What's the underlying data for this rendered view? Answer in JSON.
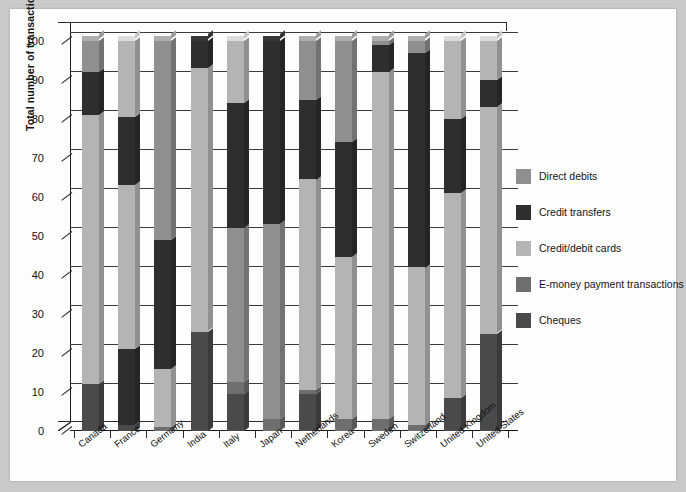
{
  "chart_data": {
    "type": "bar",
    "subtype": "stacked-percentage-3d",
    "title": "",
    "xlabel": "",
    "ylabel": "Total number of transactions (%)",
    "ylim": [
      0,
      100
    ],
    "yticks": [
      0,
      10,
      20,
      30,
      40,
      50,
      60,
      70,
      80,
      90,
      100
    ],
    "ytick_labels": [
      "0",
      "10",
      "20",
      "30",
      "40",
      "50",
      "60",
      "70",
      "80",
      "90",
      "100"
    ],
    "grid": true,
    "legend_position": "right",
    "categories": [
      "Canada",
      "France",
      "Germany",
      "India",
      "Italy",
      "Japan",
      "Netherlands",
      "Korea",
      "Sweden",
      "Switzerland",
      "United Kingdom",
      "United States"
    ],
    "series": [
      {
        "name": "Cheques",
        "color": "#4a4a4a",
        "values": [
          12.0,
          1.5,
          0.0,
          25.5,
          9.5,
          0.0,
          9.5,
          0.0,
          0.0,
          0.0,
          8.5,
          25.0
        ]
      },
      {
        "name": "E-money payment transactions",
        "color": "#6e6e6e",
        "values": [
          0.0,
          0.0,
          1.0,
          0.0,
          3.0,
          3.0,
          0.5,
          3.0,
          3.0,
          1.5,
          0.0,
          0.0
        ]
      },
      {
        "name": "Credit/debit cards",
        "color": "#b4b4b4",
        "values": [
          69.0,
          61.0,
          15.0,
          67.5,
          0.0,
          0.0,
          54.0,
          41.0,
          89.0,
          40.5,
          52.5,
          58.0
        ]
      },
      {
        "name": "Credit transfers",
        "color": "#2e2e2e",
        "values": [
          11.0,
          17.5,
          33.0,
          7.0,
          39.5,
          0.0,
          0.0,
          0.0,
          7.0,
          0.0,
          0.0,
          0.0
        ]
      },
      {
        "name": "Direct debits",
        "color": "#8f8f8f",
        "values": [
          8.0,
          20.0,
          51.0,
          0.0,
          0.0,
          50.0,
          0.0,
          0.0,
          1.0,
          1.0,
          0.0,
          0.0
        ]
      }
    ],
    "stacks": [
      {
        "category": "Canada",
        "segments": [
          {
            "series": "Cheques",
            "from": 0,
            "to": 12
          },
          {
            "series": "Credit/debit cards",
            "from": 12,
            "to": 81
          },
          {
            "series": "Credit transfers",
            "from": 81,
            "to": 92
          },
          {
            "series": "Direct debits",
            "from": 92,
            "to": 100
          }
        ]
      },
      {
        "category": "France",
        "segments": [
          {
            "series": "Cheques",
            "from": 0,
            "to": 1.5
          },
          {
            "series": "Credit transfers",
            "from": 1.5,
            "to": 21
          },
          {
            "series": "Credit/debit cards",
            "from": 21,
            "to": 63
          },
          {
            "series": "Credit transfers",
            "from": 63,
            "to": 80.5
          },
          {
            "series": "Credit/debit cards",
            "from": 80.5,
            "to": 100
          }
        ]
      },
      {
        "category": "Germany",
        "segments": [
          {
            "series": "E-money payment transactions",
            "from": 0,
            "to": 1
          },
          {
            "series": "Credit/debit cards",
            "from": 1,
            "to": 16
          },
          {
            "series": "Credit transfers",
            "from": 16,
            "to": 49
          },
          {
            "series": "Direct debits",
            "from": 49,
            "to": 100
          }
        ]
      },
      {
        "category": "India",
        "segments": [
          {
            "series": "Cheques",
            "from": 0,
            "to": 25.5
          },
          {
            "series": "Credit/debit cards",
            "from": 25.5,
            "to": 93
          },
          {
            "series": "Credit transfers",
            "from": 93,
            "to": 100
          }
        ]
      },
      {
        "category": "Italy",
        "segments": [
          {
            "series": "Cheques",
            "from": 0,
            "to": 9.5
          },
          {
            "series": "E-money payment transactions",
            "from": 9.5,
            "to": 12.5
          },
          {
            "series": "Direct debits",
            "from": 12.5,
            "to": 52
          },
          {
            "series": "Credit transfers",
            "from": 52,
            "to": 84
          },
          {
            "series": "Credit/debit cards",
            "from": 84,
            "to": 100
          }
        ]
      },
      {
        "category": "Japan",
        "segments": [
          {
            "series": "E-money payment transactions",
            "from": 0,
            "to": 3
          },
          {
            "series": "Direct debits",
            "from": 3,
            "to": 53
          },
          {
            "series": "Credit transfers",
            "from": 53,
            "to": 100
          }
        ]
      },
      {
        "category": "Netherlands",
        "segments": [
          {
            "series": "Cheques",
            "from": 0,
            "to": 9.5
          },
          {
            "series": "E-money payment transactions",
            "from": 9.5,
            "to": 10.5
          },
          {
            "series": "Credit/debit cards",
            "from": 10.5,
            "to": 64.5
          },
          {
            "series": "Credit transfers",
            "from": 64.5,
            "to": 85
          },
          {
            "series": "Direct debits",
            "from": 85,
            "to": 100
          }
        ]
      },
      {
        "category": "Korea",
        "segments": [
          {
            "series": "E-money payment transactions",
            "from": 0,
            "to": 3
          },
          {
            "series": "Credit/debit cards",
            "from": 3,
            "to": 44.5
          },
          {
            "series": "Credit transfers",
            "from": 44.5,
            "to": 74
          },
          {
            "series": "Direct debits",
            "from": 74,
            "to": 100
          }
        ]
      },
      {
        "category": "Sweden",
        "segments": [
          {
            "series": "E-money payment transactions",
            "from": 0,
            "to": 3
          },
          {
            "series": "Credit/debit cards",
            "from": 3,
            "to": 92
          },
          {
            "series": "Credit transfers",
            "from": 92,
            "to": 99
          },
          {
            "series": "Direct debits",
            "from": 99,
            "to": 100
          }
        ]
      },
      {
        "category": "Switzerland",
        "segments": [
          {
            "series": "E-money payment transactions",
            "from": 0,
            "to": 1.5
          },
          {
            "series": "Credit/debit cards",
            "from": 1.5,
            "to": 42
          },
          {
            "series": "Credit transfers",
            "from": 42,
            "to": 97
          },
          {
            "series": "Direct debits",
            "from": 97,
            "to": 100
          }
        ]
      },
      {
        "category": "United Kingdom",
        "segments": [
          {
            "series": "Cheques",
            "from": 0,
            "to": 8.5
          },
          {
            "series": "Credit/debit cards",
            "from": 8.5,
            "to": 61
          },
          {
            "series": "Credit transfers",
            "from": 61,
            "to": 80
          },
          {
            "series": "Credit/debit cards",
            "from": 80,
            "to": 100
          }
        ]
      },
      {
        "category": "United States",
        "segments": [
          {
            "series": "Cheques",
            "from": 0,
            "to": 25
          },
          {
            "series": "Credit/debit cards",
            "from": 25,
            "to": 83
          },
          {
            "series": "Credit transfers",
            "from": 83,
            "to": 90
          },
          {
            "series": "Credit/debit cards",
            "from": 90,
            "to": 100
          }
        ]
      }
    ],
    "legend": [
      {
        "label": "Direct debits",
        "color": "#8f8f8f"
      },
      {
        "label": "Credit transfers",
        "color": "#2e2e2e"
      },
      {
        "label": "Credit/debit cards",
        "color": "#b4b4b4"
      },
      {
        "label": "E-money payment transactions",
        "color": "#6e6e6e"
      },
      {
        "label": "Cheques",
        "color": "#4a4a4a"
      }
    ]
  }
}
